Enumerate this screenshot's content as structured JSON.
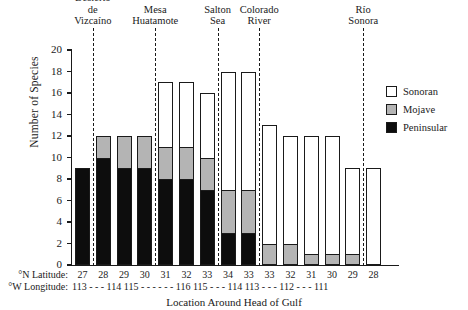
{
  "chart_data": {
    "type": "bar",
    "subtype": "stacked-bar",
    "title": "",
    "xlabel": "Location Around Head of Gulf",
    "ylabel": "Number of Species",
    "ylim": [
      0,
      20
    ],
    "yticks": [
      0,
      2,
      4,
      6,
      8,
      10,
      12,
      14,
      16,
      18,
      20
    ],
    "grid": false,
    "legend_position": "right",
    "legend": [
      {
        "name": "Sonoran",
        "color": "#ffffff"
      },
      {
        "name": "Mojave",
        "color": "#b4b4b4"
      },
      {
        "name": "Peninsular",
        "color": "#0d0d0d"
      }
    ],
    "categories": [
      "27",
      "28",
      "29",
      "30",
      "31",
      "32",
      "33",
      "34",
      "33",
      "33",
      "32",
      "31",
      "30",
      "29",
      "28"
    ],
    "category_axis_name": "°N Latitude:",
    "secondary_axis_name": "°W Longitude:",
    "secondary_axis_text": "113 - - - 114  115 - - - - - - 116  115 - - - 114  113 - - - 112 - - - 111",
    "series": [
      {
        "name": "Peninsular",
        "color": "#0d0d0d",
        "values": [
          9,
          10,
          9,
          9,
          8,
          8,
          7,
          3,
          3,
          0,
          0,
          0,
          0,
          0,
          0
        ]
      },
      {
        "name": "Mojave",
        "color": "#b4b4b4",
        "values": [
          0,
          2,
          3,
          3,
          3,
          3,
          3,
          4,
          4,
          2,
          2,
          1,
          1,
          1,
          0
        ]
      },
      {
        "name": "Sonoran",
        "color": "#ffffff",
        "values": [
          0,
          0,
          0,
          0,
          6,
          6,
          6,
          11,
          11,
          11,
          10,
          11,
          11,
          8,
          9
        ]
      }
    ],
    "totals": [
      9,
      12,
      12,
      12,
      17,
      17,
      16,
      18,
      18,
      13,
      12,
      12,
      12,
      9,
      9
    ],
    "regions": [
      {
        "label": "Desierto\nde\nVizcaíno",
        "after_bar_index": 0
      },
      {
        "label": "Mesa\nHuatamote",
        "after_bar_index": 3
      },
      {
        "label": "Salton\nSea",
        "after_bar_index": 6
      },
      {
        "label": "Colorado\nRiver",
        "after_bar_index": 8
      },
      {
        "label": "Río\nSonora",
        "after_bar_index": 13
      }
    ]
  }
}
